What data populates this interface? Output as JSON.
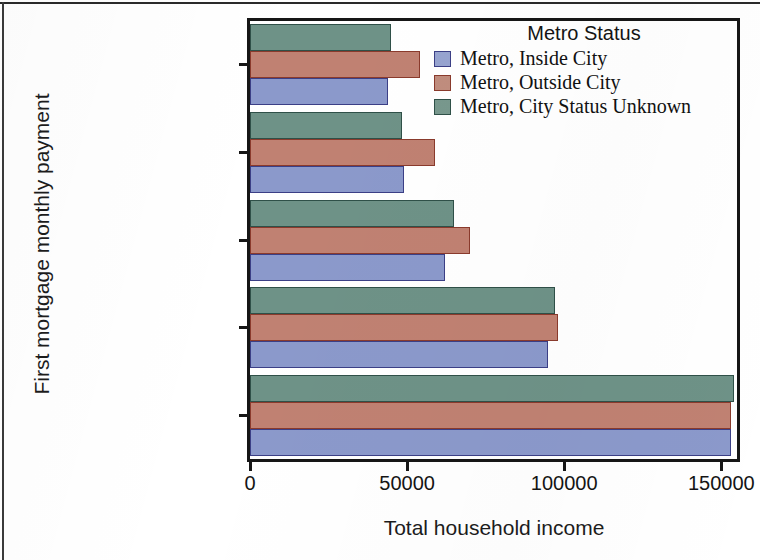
{
  "axes": {
    "y_title": "First mortgage monthly payment",
    "x_title": "Total household income"
  },
  "legend": {
    "title": "Metro Status",
    "entries": [
      {
        "label": "Metro, Inside City",
        "color": "#8b99cb"
      },
      {
        "label": "Metro, Outside City",
        "color": "#c08172"
      },
      {
        "label": "Metro, City Status Unknown",
        "color": "#6e9287"
      }
    ]
  },
  "chart_data": {
    "type": "bar",
    "orientation": "horizontal",
    "title": "",
    "xlabel": "Total household income",
    "ylabel": "First mortgage monthly payment",
    "xlim": [
      0,
      155000
    ],
    "xticks": [
      0,
      50000,
      100000,
      150000
    ],
    "xtick_labels": [
      "0",
      "50000",
      "100000",
      "150000"
    ],
    "grid": false,
    "legend_position": "top-right",
    "legend_title": "Metro Status",
    "categories": [
      "None",
      "$350 and Below",
      "$351 to $1000",
      "$1001 to $1600",
      "Over $1600"
    ],
    "series": [
      {
        "name": "Metro, Inside City",
        "color": "#8b99cb",
        "values": [
          44000,
          49000,
          62000,
          95000,
          153000
        ]
      },
      {
        "name": "Metro, Outside City",
        "color": "#c08172",
        "values": [
          54000,
          59000,
          70000,
          98000,
          153000
        ]
      },
      {
        "name": "Metro, City Status Unknown",
        "color": "#6e9287",
        "values": [
          45000,
          48500,
          65000,
          97000,
          154000
        ]
      }
    ]
  }
}
